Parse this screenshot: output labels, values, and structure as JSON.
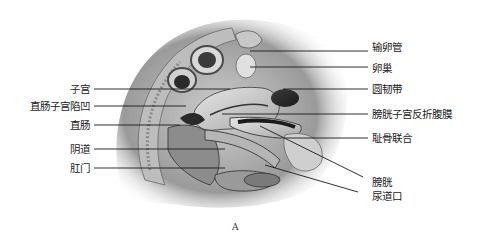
{
  "figure": {
    "caption": "A"
  },
  "labels_left": [
    {
      "id": "uterus",
      "text": "子宫",
      "x_right": 90,
      "y": 89
    },
    {
      "id": "rectouterine-pouch",
      "text": "直肠子宫陷凹",
      "x_right": 90,
      "y": 106
    },
    {
      "id": "rectum",
      "text": "直肠",
      "x_right": 90,
      "y": 125
    },
    {
      "id": "vagina",
      "text": "阴道",
      "x_right": 90,
      "y": 149
    },
    {
      "id": "anus",
      "text": "肛门",
      "x_right": 90,
      "y": 168
    }
  ],
  "labels_right": [
    {
      "id": "fallopian-tube",
      "text": "输卵管",
      "x": 372,
      "y": 47
    },
    {
      "id": "ovary",
      "text": "卵巢",
      "x": 372,
      "y": 68
    },
    {
      "id": "round-ligament",
      "text": "圆韧带",
      "x": 372,
      "y": 89
    },
    {
      "id": "vesicouterine-peritoneum",
      "text": "膀胱子宫反折腹膜",
      "x": 372,
      "y": 114
    },
    {
      "id": "pubic-symphysis",
      "text": "耻骨联合",
      "x": 372,
      "y": 138
    },
    {
      "id": "bladder",
      "text": "膀胱",
      "x": 372,
      "y": 182
    },
    {
      "id": "urethral-orifice",
      "text": "尿道口",
      "x": 372,
      "y": 196
    }
  ]
}
